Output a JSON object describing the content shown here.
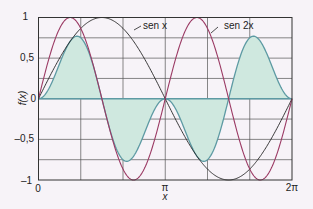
{
  "chart_data": {
    "type": "line",
    "title": "",
    "xlabel": "x",
    "ylabel": "f(x)",
    "xlim": [
      0,
      6.2832
    ],
    "ylim": [
      -1,
      1
    ],
    "x_tick_labels": [
      "0",
      "π",
      "2π"
    ],
    "y_tick_labels": [
      "1",
      "0,5",
      "0",
      "–0,5",
      "–1"
    ],
    "y_tick_values": [
      1,
      0.5,
      0,
      -0.5,
      -1
    ],
    "grid": true,
    "series": [
      {
        "name": "sen x",
        "color": "#222222",
        "function": "sin(x)"
      },
      {
        "name": "sen 2x",
        "color": "#9b3a64",
        "function": "sin(2x)"
      },
      {
        "name": "sen x · sen 2x",
        "color": "#5d9aa3",
        "fill": "#cfe8df",
        "function": "sin(x)*sin(2x)",
        "x": [
          0,
          0.5,
          0.955,
          1.2,
          1.5708,
          2.0,
          2.19,
          2.5,
          3.1416,
          3.5,
          4.09,
          4.5,
          4.7124,
          5.0,
          5.33,
          5.8,
          6.2832
        ],
        "values": [
          0,
          0.4,
          0.77,
          0.63,
          0,
          -0.69,
          -0.77,
          -0.57,
          0,
          0.23,
          0.77,
          0.41,
          0,
          -0.52,
          -0.77,
          -0.43,
          0
        ]
      }
    ],
    "annotations": [
      {
        "text": "sen x"
      },
      {
        "text": "sen 2x"
      }
    ]
  },
  "labels": {
    "y_axis": "f(x)",
    "x_axis": "x",
    "series_sin": "sen x",
    "series_sin2": "sen 2x",
    "y1": "1",
    "y05": "0,5",
    "y0": "0",
    "ym05": "–0,5",
    "ym1": "–1",
    "x0": "0",
    "xpi": "π",
    "x2pi": "2π"
  }
}
